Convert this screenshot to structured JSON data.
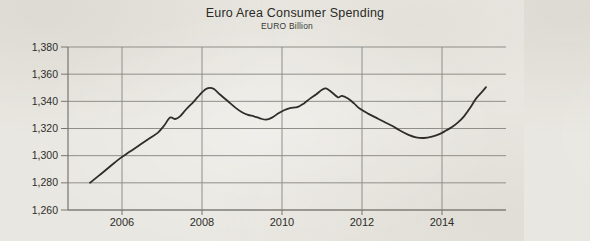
{
  "chart_data": {
    "type": "line",
    "title": "Euro Area Consumer Spending",
    "subtitle": "EURO Billion",
    "xlabel": "",
    "ylabel": "EURO Billion",
    "ylim": [
      1260,
      1380
    ],
    "y_tick_step": 20,
    "y_ticks": [
      {
        "value": 1260,
        "label": "1,260"
      },
      {
        "value": 1280,
        "label": "1,280"
      },
      {
        "value": 1300,
        "label": "1,300"
      },
      {
        "value": 1320,
        "label": "1,320"
      },
      {
        "value": 1340,
        "label": "1,340"
      },
      {
        "value": 1360,
        "label": "1,360"
      },
      {
        "value": 1380,
        "label": "1,380"
      }
    ],
    "xlim": [
      2004.65,
      2015.6
    ],
    "x_ticks": [
      {
        "value": 2006,
        "label": "2006"
      },
      {
        "value": 2008,
        "label": "2008"
      },
      {
        "value": 2010,
        "label": "2010"
      },
      {
        "value": 2012,
        "label": "2012"
      },
      {
        "value": 2014,
        "label": "2014"
      }
    ],
    "grid": true,
    "legend": null,
    "colors": {
      "paper": "#e9e7e1",
      "grid": "#8f8e89",
      "axis": "#77766f",
      "line": "#2e2d2a",
      "text": "#2e2d29"
    },
    "series": [
      {
        "name": "Euro Area Consumer Spending",
        "color": "#2e2d2a",
        "points": [
          [
            2005.2,
            1280
          ],
          [
            2005.45,
            1286
          ],
          [
            2005.7,
            1292
          ],
          [
            2005.95,
            1298
          ],
          [
            2006.2,
            1303
          ],
          [
            2006.45,
            1308
          ],
          [
            2006.7,
            1313
          ],
          [
            2006.9,
            1317
          ],
          [
            2007.05,
            1322
          ],
          [
            2007.2,
            1328
          ],
          [
            2007.33,
            1327
          ],
          [
            2007.45,
            1329
          ],
          [
            2007.6,
            1334
          ],
          [
            2007.8,
            1340
          ],
          [
            2007.95,
            1345
          ],
          [
            2008.1,
            1349
          ],
          [
            2008.2,
            1350
          ],
          [
            2008.3,
            1349
          ],
          [
            2008.45,
            1345
          ],
          [
            2008.65,
            1340
          ],
          [
            2008.85,
            1335
          ],
          [
            2009.0,
            1332
          ],
          [
            2009.15,
            1330
          ],
          [
            2009.3,
            1329
          ],
          [
            2009.45,
            1327.5
          ],
          [
            2009.6,
            1326.5
          ],
          [
            2009.75,
            1328
          ],
          [
            2009.9,
            1331
          ],
          [
            2010.05,
            1333.5
          ],
          [
            2010.2,
            1335
          ],
          [
            2010.4,
            1336
          ],
          [
            2010.55,
            1338.5
          ],
          [
            2010.7,
            1342
          ],
          [
            2010.85,
            1345
          ],
          [
            2011.0,
            1348.5
          ],
          [
            2011.1,
            1349.5
          ],
          [
            2011.25,
            1346.5
          ],
          [
            2011.4,
            1343
          ],
          [
            2011.5,
            1344
          ],
          [
            2011.65,
            1342
          ],
          [
            2011.8,
            1338.5
          ],
          [
            2011.95,
            1334.5
          ],
          [
            2012.15,
            1331
          ],
          [
            2012.35,
            1328
          ],
          [
            2012.55,
            1325
          ],
          [
            2012.75,
            1322
          ],
          [
            2012.95,
            1318.5
          ],
          [
            2013.15,
            1315.5
          ],
          [
            2013.35,
            1313.5
          ],
          [
            2013.55,
            1313
          ],
          [
            2013.75,
            1314
          ],
          [
            2013.95,
            1316
          ],
          [
            2014.1,
            1318.5
          ],
          [
            2014.25,
            1321
          ],
          [
            2014.4,
            1324.5
          ],
          [
            2014.55,
            1329
          ],
          [
            2014.7,
            1335
          ],
          [
            2014.85,
            1342
          ],
          [
            2015.0,
            1347
          ],
          [
            2015.1,
            1350.5
          ]
        ]
      }
    ]
  }
}
